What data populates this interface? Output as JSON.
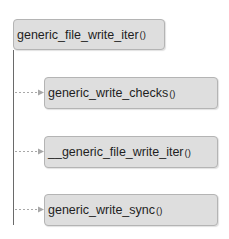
{
  "diagram": {
    "type": "call-tree",
    "root": {
      "name": "generic_file_write_iter",
      "suffix": "()"
    },
    "children": [
      {
        "name": "generic_write_checks",
        "suffix": "()"
      },
      {
        "name": "__generic_file_write_iter",
        "suffix": "()"
      },
      {
        "name": "generic_write_sync",
        "suffix": "()"
      }
    ],
    "colors": {
      "node_fill": "#dedede",
      "node_border": "#b4b4b4",
      "trunk_line": "#6a6a6a",
      "arrow": "#a8a8a8"
    }
  }
}
